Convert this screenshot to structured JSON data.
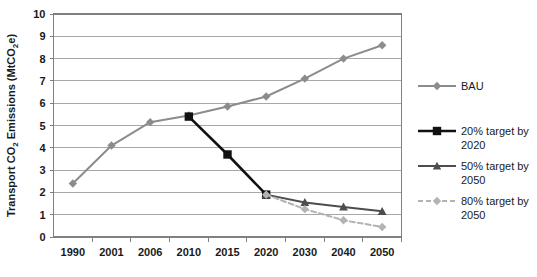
{
  "chart_data": {
    "type": "line",
    "title": "",
    "xlabel": "",
    "ylabel": "Transport CO2 Emissions (MtCO2e)",
    "ylabel_parts": {
      "pre": "Transport CO",
      "sub1": "2",
      "mid": " Emissions (MtCO",
      "sub2": "2",
      "post": "e)"
    },
    "categories": [
      "1990",
      "2001",
      "2006",
      "2010",
      "2015",
      "2020",
      "2030",
      "2040",
      "2050"
    ],
    "ylim": [
      0,
      10
    ],
    "yticks": [
      "0",
      "1",
      "2",
      "3",
      "4",
      "5",
      "6",
      "7",
      "8",
      "9",
      "10"
    ],
    "grid": true,
    "legend_position": "right",
    "series": [
      {
        "name": "BAU",
        "color": "#8c8c8c",
        "marker": "diamond",
        "dash": "none",
        "width": 2,
        "x": [
          "1990",
          "2001",
          "2006",
          "2010",
          "2015",
          "2020",
          "2030",
          "2040",
          "2050"
        ],
        "values": [
          2.4,
          4.1,
          5.15,
          5.45,
          5.85,
          6.3,
          7.1,
          8.0,
          8.6
        ]
      },
      {
        "name": "20% target by 2050",
        "label_line1": "20% target by",
        "label_line2": "2020",
        "color": "#111111",
        "marker": "square",
        "dash": "none",
        "width": 2.6,
        "x": [
          "2010",
          "2015",
          "2020"
        ],
        "values": [
          5.4,
          3.7,
          1.9
        ]
      },
      {
        "name": "50% target by 2050",
        "label_line1": "50% target by",
        "label_line2": "2050",
        "color": "#4d4d4d",
        "marker": "triangle",
        "dash": "none",
        "width": 2,
        "x": [
          "2020",
          "2030",
          "2040",
          "2050"
        ],
        "values": [
          1.9,
          1.55,
          1.35,
          1.15
        ]
      },
      {
        "name": "80% target by 2050",
        "label_line1": "80% target by",
        "label_line2": "2050",
        "color": "#b3b3b3",
        "marker": "diamond",
        "dash": "5,3",
        "width": 2,
        "x": [
          "2020",
          "2030",
          "2040",
          "2050"
        ],
        "values": [
          1.9,
          1.25,
          0.75,
          0.45
        ]
      }
    ]
  },
  "legend": {
    "items": [
      {
        "label_line1": "BAU",
        "label_line2": ""
      },
      {
        "label_line1": "20% target by",
        "label_line2": "2020"
      },
      {
        "label_line1": "50% target by",
        "label_line2": "2050"
      },
      {
        "label_line1": "80% target by",
        "label_line2": "2050"
      }
    ]
  },
  "colors": {
    "bau": "#8c8c8c",
    "target20": "#111111",
    "target50": "#4d4d4d",
    "target80": "#b3b3b3",
    "grid": "#a8a8a8",
    "axis": "#808080",
    "text": "#1a1a1a"
  }
}
